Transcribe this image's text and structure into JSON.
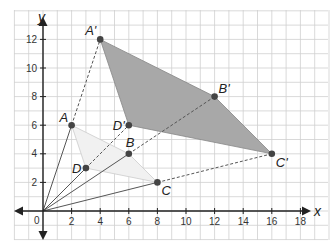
{
  "diagram": {
    "type": "coordinate-plane-dilation",
    "axes": {
      "x_label": "x",
      "y_label": "y",
      "origin_label": "0",
      "x_ticks": [
        "2",
        "4",
        "6",
        "8",
        "10",
        "12",
        "14",
        "16",
        "18"
      ],
      "y_ticks": [
        "2",
        "4",
        "6",
        "8",
        "10",
        "12"
      ],
      "x_range": [
        -2,
        20
      ],
      "y_range": [
        -2,
        14
      ]
    },
    "center_of_dilation": {
      "x": 0,
      "y": 0
    },
    "scale_factor": 2,
    "preimage": {
      "name": "ABCD",
      "fill": "#f1f1f1",
      "points": [
        {
          "label": "A",
          "x": 2,
          "y": 6
        },
        {
          "label": "B",
          "x": 6,
          "y": 4
        },
        {
          "label": "C",
          "x": 8,
          "y": 2
        },
        {
          "label": "D",
          "x": 3,
          "y": 3
        }
      ]
    },
    "image": {
      "name": "A'B'C'D'",
      "fill": "#a8a8a8",
      "points": [
        {
          "label": "A'",
          "x": 4,
          "y": 12
        },
        {
          "label": "B'",
          "x": 12,
          "y": 8
        },
        {
          "label": "C'",
          "x": 16,
          "y": 4
        },
        {
          "label": "D'",
          "x": 6,
          "y": 6
        }
      ]
    },
    "colors": {
      "grid": "#cfcfcf",
      "axis": "#222222",
      "point": "#444444",
      "ray_solid": "#555555",
      "ray_dashed": "#555555"
    }
  }
}
